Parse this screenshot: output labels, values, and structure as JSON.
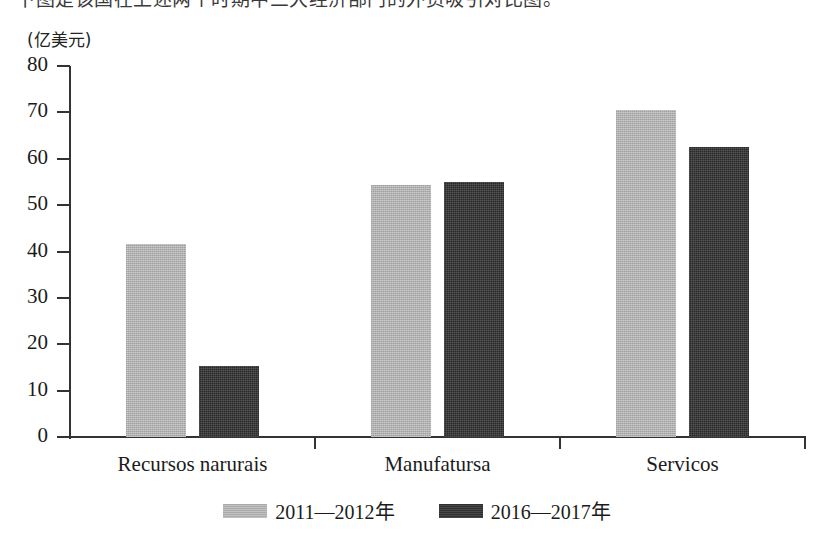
{
  "figure": {
    "clipped_heading_text": "下图是该国在上述两个时期中三大经济部门的外资吸引对比图。",
    "clipped_footer_text": "",
    "y_axis_unit": "(亿美元)"
  },
  "chart_data": {
    "type": "bar",
    "title": "",
    "subtitle": "",
    "xlabel": "",
    "ylabel": "(亿美元)",
    "ylim": [
      0,
      80
    ],
    "yticks": [
      0,
      10,
      20,
      30,
      40,
      50,
      60,
      70,
      80
    ],
    "ytick_labels": [
      "0",
      "10",
      "20",
      "30",
      "40",
      "50",
      "60",
      "70",
      "80"
    ],
    "grid": false,
    "legend_position": "bottom-center",
    "categories": [
      "Recursos narurais",
      "Manufatursa",
      "Servicos"
    ],
    "series": [
      {
        "name": "2011—2012年",
        "color": "#a9a9a9",
        "values": [
          41.6,
          54.3,
          70.5
        ]
      },
      {
        "name": "2016—2017年",
        "color": "#2f2f2f",
        "values": [
          15.3,
          55.0,
          62.5
        ]
      }
    ]
  },
  "legend": {
    "items": [
      {
        "label": "2011—2012年",
        "swatch": "light-gray-swatch"
      },
      {
        "label": "2016—2017年",
        "swatch": "dark-gray-swatch"
      }
    ]
  }
}
